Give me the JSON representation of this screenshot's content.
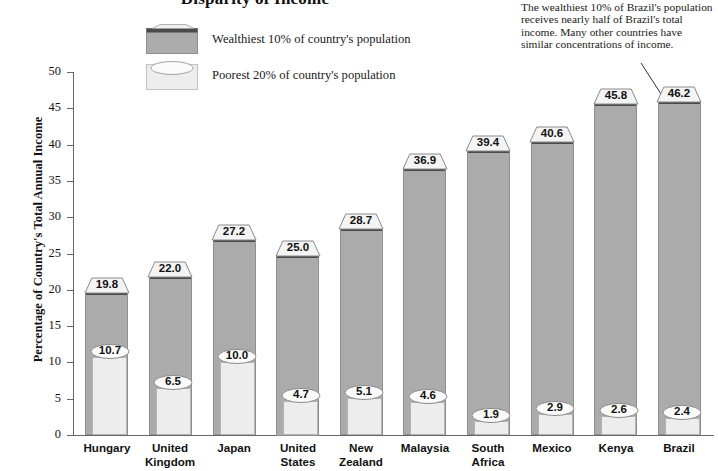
{
  "chart_data": {
    "type": "bar",
    "title": "Disparity of Income",
    "xlabel": "",
    "ylabel": "Percentage of Country's Total Annual Income",
    "ylim": [
      0,
      50
    ],
    "ytick_step": 5,
    "yticks": [
      "50",
      "45",
      "40",
      "35",
      "30",
      "25",
      "20",
      "15",
      "10",
      "5",
      "0"
    ],
    "grid": false,
    "legend_position": "top-center",
    "categories": [
      "Hungary",
      "United Kingdom",
      "Japan",
      "United States",
      "New Zealand",
      "Malaysia",
      "South Africa",
      "Mexico",
      "Kenya",
      "Brazil"
    ],
    "category_lines": [
      [
        "Hungary"
      ],
      [
        "United",
        "Kingdom"
      ],
      [
        "Japan"
      ],
      [
        "United",
        "States"
      ],
      [
        "New",
        "Zealand"
      ],
      [
        "Malaysia"
      ],
      [
        "South",
        "Africa"
      ],
      [
        "Mexico"
      ],
      [
        "Kenya"
      ],
      [
        "Brazil"
      ]
    ],
    "series": [
      {
        "name": "Wealthiest 10% of country's population",
        "color": "#ababab",
        "values": [
          19.8,
          22.0,
          27.2,
          25.0,
          28.7,
          36.9,
          39.4,
          40.6,
          45.8,
          46.2
        ],
        "labels": [
          "19.8",
          "22.0",
          "27.2",
          "25.0",
          "28.7",
          "36.9",
          "39.4",
          "40.6",
          "45.8",
          "46.2"
        ]
      },
      {
        "name": "Poorest 20% of country's population",
        "color": "#ededed",
        "values": [
          10.7,
          6.5,
          10.0,
          4.7,
          5.1,
          4.6,
          1.9,
          2.9,
          2.6,
          2.4
        ],
        "labels": [
          "10.7",
          "6.5",
          "10.0",
          "4.7",
          "5.1",
          "4.6",
          "1.9",
          "2.9",
          "2.6",
          "2.4"
        ]
      }
    ],
    "annotation": "The wealthiest 10% of Brazil's population receives nearly half of Brazil's total income.  Many other countries have similar concentrations of income."
  },
  "legend": {
    "items": [
      {
        "label": "Wealthiest 10% of country's population",
        "swatch": "dark-gray-3d-swatch"
      },
      {
        "label": "Poorest 20% of country's population",
        "swatch": "light-gray-3d-swatch"
      }
    ]
  }
}
